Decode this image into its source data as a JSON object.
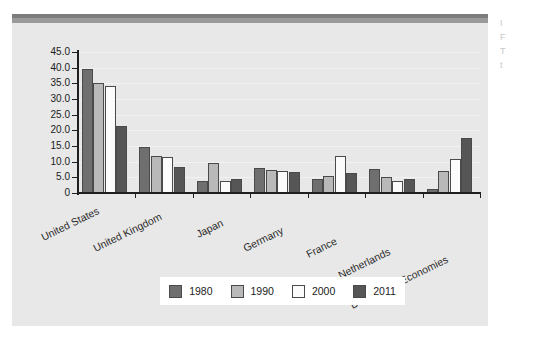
{
  "page": {
    "background_color": "#ffffff",
    "panel_color": "#e8e8e8",
    "topbar_color": "#7d7d7d"
  },
  "side_fragments": [
    {
      "text": "I"
    },
    {
      "text": "F"
    },
    {
      "text": "T"
    },
    {
      "text": "t"
    }
  ],
  "legend": {
    "position": "bottom-center",
    "items": [
      {
        "label": "1980",
        "color": "#6f6f6f"
      },
      {
        "label": "1990",
        "color": "#b9b9b9"
      },
      {
        "label": "2000",
        "color": "#fbfbfb"
      },
      {
        "label": "2011",
        "color": "#565656"
      }
    ]
  },
  "chart_data": {
    "type": "bar",
    "title": "",
    "subtitle": "",
    "xlabel": "",
    "ylabel": "",
    "grid": true,
    "legend_position": "bottom-center",
    "ylim": [
      0,
      45
    ],
    "yticks": [
      "0",
      "5.0",
      "10.0",
      "15.0",
      "20.0",
      "25.0",
      "30.0",
      "35.0",
      "40.0",
      "45.0"
    ],
    "ytick_values": [
      0,
      5,
      10,
      15,
      20,
      25,
      30,
      35,
      40,
      45
    ],
    "categories": [
      "United States",
      "United Kingdom",
      "Japan",
      "Germany",
      "France",
      "Netherlands",
      "Developing Economies"
    ],
    "series": [
      {
        "name": "1980",
        "color": "#6f6f6f",
        "values": [
          39.5,
          14.7,
          3.8,
          7.9,
          4.6,
          7.7,
          1.3
        ]
      },
      {
        "name": "1990",
        "color": "#b9b9b9",
        "values": [
          35.0,
          11.7,
          9.6,
          7.2,
          5.4,
          5.0,
          6.9
        ]
      },
      {
        "name": "2000",
        "color": "#fbfbfb",
        "values": [
          34.0,
          11.5,
          3.8,
          6.9,
          11.8,
          3.7,
          10.7
        ]
      },
      {
        "name": "2011",
        "color": "#565656",
        "values": [
          21.3,
          8.2,
          4.5,
          6.6,
          6.5,
          4.4,
          17.5
        ]
      }
    ]
  }
}
